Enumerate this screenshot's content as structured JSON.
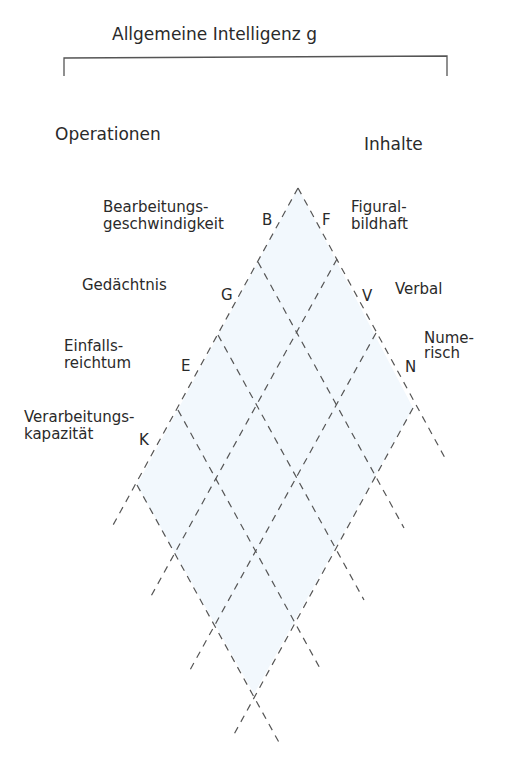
{
  "title": "Allgemeine Intelligenz g",
  "headers": {
    "operations": "Operationen",
    "contents": "Inhalte"
  },
  "operations": [
    {
      "letter": "B",
      "line1": "Bearbeitungs-",
      "line2": "geschwindigkeit"
    },
    {
      "letter": "G",
      "line1": "Gedächtnis",
      "line2": ""
    },
    {
      "letter": "E",
      "line1": "Einfalls-",
      "line2": "reichtum"
    },
    {
      "letter": "K",
      "line1": "Verarbeitungs-",
      "line2": "kapazität"
    }
  ],
  "contents": [
    {
      "letter": "F",
      "line1": "Figural-",
      "line2": "bildhaft"
    },
    {
      "letter": "V",
      "line1": "Verbal",
      "line2": ""
    },
    {
      "letter": "N",
      "line1": "Nume-",
      "line2": "risch"
    }
  ],
  "colors": {
    "line": "#555555",
    "fill": "#f2f8fd",
    "text": "#2a2a2a"
  }
}
